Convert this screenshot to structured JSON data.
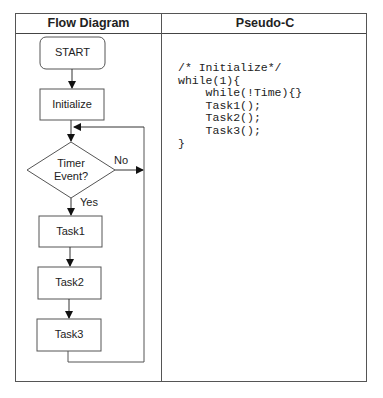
{
  "table": {
    "headers": {
      "left": "Flow Diagram",
      "right": "Pseudo-C"
    }
  },
  "flow": {
    "start": "START",
    "initialize": "Initialize",
    "decision_line1": "Timer",
    "decision_line2": "Event?",
    "no_label": "No",
    "yes_label": "Yes",
    "task1": "Task1",
    "task2": "Task2",
    "task3": "Task3"
  },
  "code": {
    "lines": [
      "/* Initialize*/",
      "while(1){",
      "    while(!Time){}",
      "    Task1();",
      "    Task2();",
      "    Task3();",
      "}"
    ]
  }
}
